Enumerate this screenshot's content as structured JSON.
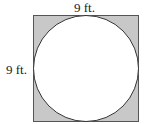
{
  "diagram": {
    "square": {
      "side_length_label": "9 ft.",
      "fill_color": "#c8c8c8",
      "stroke_color": "#444444"
    },
    "circle": {
      "fill_color": "#ffffff",
      "stroke_color": "#333333"
    },
    "labels": {
      "top": "9 ft.",
      "left": "9 ft."
    }
  }
}
